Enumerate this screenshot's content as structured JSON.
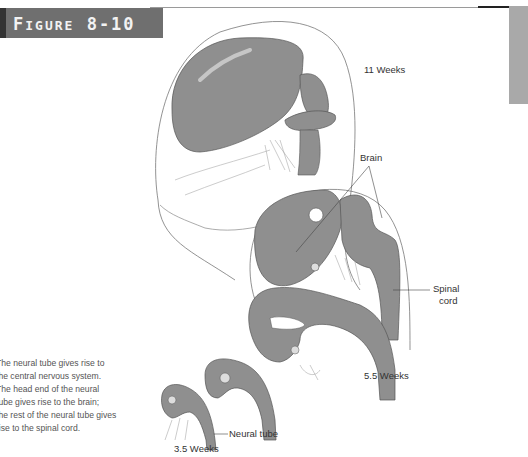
{
  "figure": {
    "number_prefix": "F",
    "number_rest": "IGURE",
    "number": "8-10"
  },
  "caption": {
    "lines": [
      "The neural tube gives rise to",
      "the central nervous system.",
      "The head end of the neural",
      "tube gives rise to the brain;",
      "the rest of the neural tube gives",
      "rise to the spinal cord."
    ]
  },
  "labels": {
    "stage_11": "11 Weeks",
    "brain": "Brain",
    "spinal_1": "Spinal",
    "spinal_2": "cord",
    "stage_5_5": "5.5 Weeks",
    "neural_tube": "Neural tube",
    "stage_3_5": "3.5 Weeks"
  },
  "colors": {
    "tissue": "#8f8f8f",
    "banner": "#6f6f6f",
    "sidetab": "#a9a9a9"
  }
}
